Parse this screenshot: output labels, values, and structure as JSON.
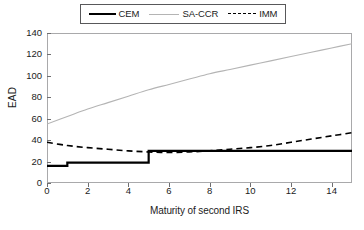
{
  "chart_data": {
    "type": "line",
    "title": "",
    "xlabel": "Maturity of second IRS",
    "ylabel": "EAD",
    "xlim": [
      0,
      15
    ],
    "ylim": [
      0,
      140
    ],
    "xticks": [
      0,
      2,
      4,
      6,
      8,
      10,
      12,
      14
    ],
    "yticks": [
      0,
      20,
      40,
      60,
      80,
      100,
      120,
      140
    ],
    "grid": false,
    "legend_position": "top-center",
    "series": [
      {
        "name": "CEM",
        "style": "solid",
        "color": "#000000",
        "width": 2.2,
        "shape": "step",
        "x": [
          0,
          1,
          1,
          5,
          5,
          15
        ],
        "values": [
          16,
          16,
          19,
          19,
          30,
          30
        ]
      },
      {
        "name": "SA-CCR",
        "style": "solid",
        "color": "#b4b4b4",
        "width": 1.1,
        "shape": "curve",
        "x": [
          0,
          1,
          2,
          3,
          4,
          5,
          6,
          7,
          8,
          9,
          10,
          11,
          12,
          13,
          14,
          15
        ],
        "values": [
          55,
          62,
          69,
          75,
          81,
          87,
          92,
          97,
          102,
          106,
          110,
          114,
          118,
          122,
          126,
          130
        ]
      },
      {
        "name": "IMM",
        "style": "dashed",
        "color": "#000000",
        "width": 1.8,
        "shape": "curve",
        "x": [
          0,
          1,
          2,
          3,
          4,
          5,
          6,
          7,
          8,
          9,
          10,
          11,
          12,
          13,
          14,
          15
        ],
        "values": [
          38,
          35,
          33,
          31.5,
          30,
          29,
          28.5,
          29,
          30,
          31.5,
          33,
          35,
          38,
          41,
          44,
          47
        ]
      }
    ]
  },
  "legend": {
    "items": [
      {
        "label": "CEM"
      },
      {
        "label": "SA-CCR"
      },
      {
        "label": "IMM"
      }
    ]
  },
  "axes": {
    "y_label": "EAD",
    "x_label": "Maturity of second IRS",
    "y_ticks": [
      "0",
      "20",
      "40",
      "60",
      "80",
      "100",
      "120",
      "140"
    ],
    "x_ticks": [
      "0",
      "2",
      "4",
      "6",
      "8",
      "10",
      "12",
      "14"
    ]
  }
}
